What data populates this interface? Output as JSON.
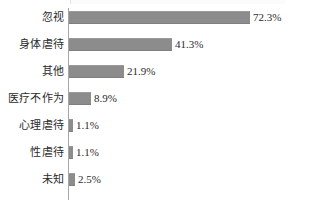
{
  "chart_data": {
    "type": "bar",
    "orientation": "horizontal",
    "title": "",
    "subtitle": "",
    "xlabel": "",
    "ylabel": "",
    "grid": false,
    "legend": false,
    "legend_position": "none",
    "axis_line_color": "#a6a6a6",
    "bar_color": "#8c8c8c",
    "text_color": "#2b2b2b",
    "background_color": "#ffffff",
    "xlim": [
      0,
      80
    ],
    "value_suffix": "%",
    "categories": [
      "忽视",
      "身体虐待",
      "其他",
      "医疗不作为",
      "心理虐待",
      "性虐待",
      "未知"
    ],
    "values": [
      72.3,
      41.3,
      21.9,
      8.9,
      1.1,
      1.1,
      2.5
    ],
    "value_labels": [
      "72.3%",
      "41.3%",
      "21.9%",
      "8.9%",
      "1.1%",
      "1.1%",
      "2.5%"
    ],
    "points": [
      {
        "category": "忽视",
        "value": 72.3,
        "label": "72.3%"
      },
      {
        "category": "身体虐待",
        "value": 41.3,
        "label": "41.3%"
      },
      {
        "category": "其他",
        "value": 21.9,
        "label": "21.9%"
      },
      {
        "category": "医疗不作为",
        "value": 8.9,
        "label": "8.9%"
      },
      {
        "category": "心理虐待",
        "value": 1.1,
        "label": "1.1%"
      },
      {
        "category": "性虐待",
        "value": 1.1,
        "label": "1.1%"
      },
      {
        "category": "未知",
        "value": 2.5,
        "label": "2.5%"
      }
    ]
  }
}
